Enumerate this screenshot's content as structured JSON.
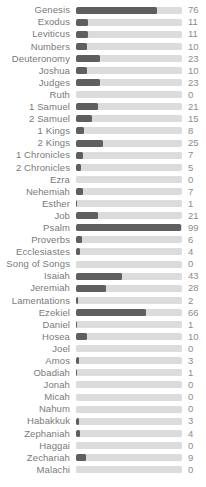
{
  "chart_data": {
    "type": "bar",
    "orientation": "horizontal",
    "title": "",
    "xlabel": "",
    "ylabel": "",
    "xlim": [
      0,
      100
    ],
    "grid": false,
    "legend": null,
    "bar_color": "#5f5f5f",
    "track_color": "#dcdcdc",
    "label_color": "#7a7a7a",
    "value_color": "#8c8c8c",
    "categories": [
      "Genesis",
      "Exodus",
      "Leviticus",
      "Numbers",
      "Deuteronomy",
      "Joshua",
      "Judges",
      "Ruth",
      "1 Samuel",
      "2 Samuel",
      "1 Kings",
      "2 Kings",
      "1 Chronicles",
      "2 Chronicles",
      "Ezra",
      "Nehemiah",
      "Esther",
      "Job",
      "Psalm",
      "Proverbs",
      "Ecclesiastes",
      "Song of Songs",
      "Isaiah",
      "Jeremiah",
      "Lamentations",
      "Ezekiel",
      "Daniel",
      "Hosea",
      "Joel",
      "Amos",
      "Obadiah",
      "Jonah",
      "Micah",
      "Nahum",
      "Habakkuk",
      "Zephaniah",
      "Haggai",
      "Zechariah",
      "Malachi"
    ],
    "values": [
      76,
      11,
      11,
      10,
      23,
      10,
      23,
      0,
      21,
      15,
      8,
      25,
      7,
      5,
      0,
      7,
      1,
      21,
      99,
      6,
      4,
      0,
      43,
      28,
      2,
      66,
      1,
      10,
      0,
      3,
      1,
      0,
      0,
      0,
      3,
      4,
      0,
      9,
      0
    ]
  }
}
